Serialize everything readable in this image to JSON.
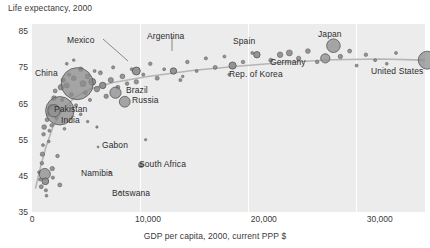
{
  "chart_data": {
    "type": "scatter",
    "title": "",
    "ylabel": "Life expectancy, 2000",
    "xlabel": "GDP per capita, 2000, current PPP $",
    "xlim": [
      0,
      33900
    ],
    "ylim": [
      35,
      87
    ],
    "yticks": [
      85,
      75,
      65,
      55,
      45,
      35
    ],
    "xticks": [
      0,
      10000,
      20000,
      30000
    ],
    "xticklabels": [
      "0",
      "10,000",
      "20,000",
      "30,000"
    ],
    "yticklabels": [
      "85",
      "75",
      "65",
      "55",
      "45",
      "35"
    ],
    "grid": "vertical-white-lines",
    "legend": "none",
    "marker": "bubble, area proportional to population",
    "trendline": "smoothed fit, light grey, rising steeply then flattening above 75 years",
    "plot_background": "#ececec",
    "bubble_fill": "#8c8c8c",
    "bubble_stroke": "#555555",
    "trend_color": "#b5b5b5",
    "labeled_points": [
      {
        "name": "Mexico",
        "gdp": 9000,
        "life": 74.0,
        "r": 4.0,
        "label_x": 67,
        "label_y": 35,
        "leader": [
          103,
          39,
          128,
          61
        ]
      },
      {
        "name": "Argentina",
        "gdp": 12200,
        "life": 74.0,
        "r": 3.2,
        "label_x": 147,
        "label_y": 31,
        "leader": [
          172,
          36,
          172,
          51
        ]
      },
      {
        "name": "Spain",
        "gdp": 19400,
        "life": 78.5,
        "r": 3.2,
        "label_x": 233,
        "label_y": 36,
        "leader": null
      },
      {
        "name": "Germany",
        "gdp": 25300,
        "life": 77.5,
        "r": 4.6,
        "label_x": 270,
        "label_y": 57,
        "leader": null
      },
      {
        "name": "Japan",
        "gdp": 26000,
        "life": 81.0,
        "r": 6.8,
        "label_x": 318,
        "label_y": 29,
        "leader": null
      },
      {
        "name": "Rep. of Korea",
        "gdp": 17300,
        "life": 75.5,
        "r": 3.6,
        "label_x": 229,
        "label_y": 69,
        "leader": null
      },
      {
        "name": "United States",
        "gdp": 34100,
        "life": 77.0,
        "r": 9.0,
        "label_x": 371,
        "label_y": 66,
        "leader": null
      },
      {
        "name": "China",
        "gdp": 3900,
        "life": 70.5,
        "r": 16.0,
        "label_x": 35,
        "label_y": 68,
        "leader": null
      },
      {
        "name": "India",
        "gdp": 2400,
        "life": 63.0,
        "r": 14.2,
        "label_x": 61,
        "label_y": 115,
        "leader": null
      },
      {
        "name": "Pakistan",
        "gdp": 1900,
        "life": 63.0,
        "r": 6.2,
        "label_x": 54,
        "label_y": 104,
        "leader": null
      },
      {
        "name": "Brazil",
        "gdp": 7200,
        "life": 68.0,
        "r": 5.6,
        "label_x": 126,
        "label_y": 85,
        "leader": null
      },
      {
        "name": "Russia",
        "gdp": 8000,
        "life": 65.5,
        "r": 5.4,
        "label_x": 132,
        "label_y": 95,
        "leader": null
      },
      {
        "name": "Gabon",
        "gdp": 5700,
        "life": 53.0,
        "r": 1.0,
        "label_x": 102,
        "label_y": 140,
        "leader": null
      },
      {
        "name": "South Africa",
        "gdp": 9400,
        "life": 48.0,
        "r": 2.6,
        "label_x": 139,
        "label_y": 159,
        "leader": null
      },
      {
        "name": "Namibia",
        "gdp": 6700,
        "life": 46.0,
        "r": 1.0,
        "label_x": 81,
        "label_y": 168,
        "leader": null
      },
      {
        "name": "Botswana",
        "gdp": 7600,
        "life": 40.5,
        "r": 1.0,
        "label_x": 112,
        "label_y": 188,
        "leader": null
      }
    ],
    "unlabeled_points": [
      {
        "gdp": 600,
        "life": 46.0,
        "r": 1.4
      },
      {
        "gdp": 700,
        "life": 44.0,
        "r": 1.6
      },
      {
        "gdp": 800,
        "life": 42.0,
        "r": 2.0
      },
      {
        "gdp": 850,
        "life": 48.5,
        "r": 1.8
      },
      {
        "gdp": 900,
        "life": 51.0,
        "r": 2.2
      },
      {
        "gdp": 950,
        "life": 53.5,
        "r": 1.5
      },
      {
        "gdp": 1000,
        "life": 56.5,
        "r": 1.8
      },
      {
        "gdp": 1050,
        "life": 58.5,
        "r": 2.4
      },
      {
        "gdp": 1100,
        "life": 45.5,
        "r": 5.6
      },
      {
        "gdp": 1150,
        "life": 43.5,
        "r": 3.4
      },
      {
        "gdp": 1200,
        "life": 41.0,
        "r": 1.6
      },
      {
        "gdp": 1250,
        "life": 39.5,
        "r": 1.4
      },
      {
        "gdp": 1300,
        "life": 60.5,
        "r": 2.0
      },
      {
        "gdp": 1400,
        "life": 62.0,
        "r": 1.6
      },
      {
        "gdp": 1450,
        "life": 54.5,
        "r": 1.4
      },
      {
        "gdp": 1500,
        "life": 57.5,
        "r": 1.5
      },
      {
        "gdp": 1600,
        "life": 64.0,
        "r": 2.6
      },
      {
        "gdp": 1700,
        "life": 59.0,
        "r": 1.8
      },
      {
        "gdp": 1750,
        "life": 47.0,
        "r": 2.2
      },
      {
        "gdp": 1800,
        "life": 44.5,
        "r": 1.6
      },
      {
        "gdp": 1900,
        "life": 66.5,
        "r": 2.4
      },
      {
        "gdp": 2000,
        "life": 68.5,
        "r": 2.0
      },
      {
        "gdp": 2100,
        "life": 61.0,
        "r": 1.5
      },
      {
        "gdp": 2200,
        "life": 50.5,
        "r": 1.8
      },
      {
        "gdp": 2400,
        "life": 42.5,
        "r": 2.0
      },
      {
        "gdp": 2500,
        "life": 69.5,
        "r": 2.8
      },
      {
        "gdp": 2600,
        "life": 66.0,
        "r": 1.6
      },
      {
        "gdp": 2700,
        "life": 71.5,
        "r": 2.2
      },
      {
        "gdp": 2800,
        "life": 58.0,
        "r": 1.4
      },
      {
        "gdp": 3000,
        "life": 70.0,
        "r": 2.6
      },
      {
        "gdp": 3200,
        "life": 73.0,
        "r": 1.8
      },
      {
        "gdp": 3400,
        "life": 67.5,
        "r": 2.0
      },
      {
        "gdp": 3600,
        "life": 72.0,
        "r": 2.4
      },
      {
        "gdp": 3800,
        "life": 64.5,
        "r": 1.6
      },
      {
        "gdp": 4200,
        "life": 74.5,
        "r": 2.2
      },
      {
        "gdp": 4400,
        "life": 70.5,
        "r": 3.0
      },
      {
        "gdp": 4600,
        "life": 68.0,
        "r": 2.0
      },
      {
        "gdp": 4800,
        "life": 72.5,
        "r": 2.4
      },
      {
        "gdp": 5000,
        "life": 66.0,
        "r": 1.6
      },
      {
        "gdp": 5200,
        "life": 71.0,
        "r": 3.4
      },
      {
        "gdp": 5400,
        "life": 74.0,
        "r": 1.5
      },
      {
        "gdp": 5600,
        "life": 69.0,
        "r": 2.8
      },
      {
        "gdp": 5900,
        "life": 73.5,
        "r": 2.0
      },
      {
        "gdp": 6100,
        "life": 70.0,
        "r": 3.2
      },
      {
        "gdp": 6400,
        "life": 67.0,
        "r": 2.2
      },
      {
        "gdp": 6800,
        "life": 71.5,
        "r": 2.6
      },
      {
        "gdp": 7000,
        "life": 75.0,
        "r": 1.6
      },
      {
        "gdp": 7400,
        "life": 69.5,
        "r": 2.0
      },
      {
        "gdp": 7800,
        "life": 72.5,
        "r": 2.4
      },
      {
        "gdp": 8200,
        "life": 70.5,
        "r": 1.8
      },
      {
        "gdp": 8600,
        "life": 74.5,
        "r": 1.5
      },
      {
        "gdp": 9000,
        "life": 71.0,
        "r": 2.2
      },
      {
        "gdp": 9600,
        "life": 73.0,
        "r": 1.6
      },
      {
        "gdp": 10200,
        "life": 76.0,
        "r": 1.8
      },
      {
        "gdp": 10800,
        "life": 72.0,
        "r": 2.0
      },
      {
        "gdp": 11400,
        "life": 74.5,
        "r": 1.5
      },
      {
        "gdp": 12800,
        "life": 71.5,
        "r": 1.6
      },
      {
        "gdp": 13400,
        "life": 76.5,
        "r": 1.8
      },
      {
        "gdp": 14200,
        "life": 74.0,
        "r": 1.5
      },
      {
        "gdp": 15000,
        "life": 77.5,
        "r": 1.6
      },
      {
        "gdp": 15800,
        "life": 75.0,
        "r": 2.0
      },
      {
        "gdp": 16600,
        "life": 78.0,
        "r": 1.5
      },
      {
        "gdp": 18200,
        "life": 76.5,
        "r": 1.8
      },
      {
        "gdp": 19000,
        "life": 79.0,
        "r": 1.5
      },
      {
        "gdp": 20600,
        "life": 77.0,
        "r": 2.0
      },
      {
        "gdp": 21400,
        "life": 78.5,
        "r": 2.8
      },
      {
        "gdp": 22200,
        "life": 79.0,
        "r": 3.0
      },
      {
        "gdp": 23000,
        "life": 77.5,
        "r": 2.2
      },
      {
        "gdp": 23800,
        "life": 79.5,
        "r": 2.4
      },
      {
        "gdp": 24600,
        "life": 76.5,
        "r": 1.8
      },
      {
        "gdp": 26600,
        "life": 78.0,
        "r": 2.2
      },
      {
        "gdp": 27400,
        "life": 79.5,
        "r": 2.0
      },
      {
        "gdp": 28000,
        "life": 75.5,
        "r": 1.5
      },
      {
        "gdp": 28800,
        "life": 78.5,
        "r": 1.8
      },
      {
        "gdp": 29600,
        "life": 77.0,
        "r": 1.5
      },
      {
        "gdp": 30600,
        "life": 76.0,
        "r": 1.4
      },
      {
        "gdp": 31400,
        "life": 79.0,
        "r": 1.5
      },
      {
        "gdp": 3000,
        "life": 76.0,
        "r": 1.4
      },
      {
        "gdp": 3600,
        "life": 77.0,
        "r": 1.3
      },
      {
        "gdp": 4200,
        "life": 62.0,
        "r": 1.4
      },
      {
        "gdp": 4800,
        "life": 60.0,
        "r": 1.3
      },
      {
        "gdp": 5600,
        "life": 58.5,
        "r": 1.2
      },
      {
        "gdp": 9800,
        "life": 55.0,
        "r": 1.2
      },
      {
        "gdp": 13000,
        "life": 72.5,
        "r": 1.3
      },
      {
        "gdp": 17000,
        "life": 73.0,
        "r": 1.3
      }
    ]
  }
}
